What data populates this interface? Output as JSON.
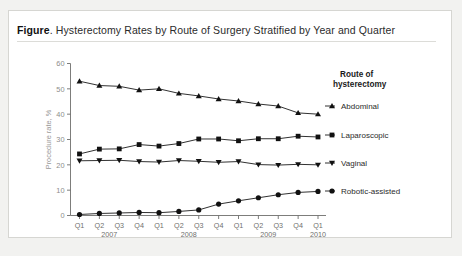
{
  "figure": {
    "label_lead": "Figure",
    "title": ". Hysterectomy Rates by Route of Surgery Stratified by Year and Quarter"
  },
  "chart_data": {
    "type": "line",
    "title": "Hysterectomy Rates by Route of Surgery Stratified by Year and Quarter",
    "xlabel": "",
    "ylabel": "Procedure rate, %",
    "ylim": [
      0,
      60
    ],
    "yticks": [
      0,
      10,
      20,
      30,
      40,
      50,
      60
    ],
    "grid": false,
    "legend_position": "right",
    "legend_title": "Route of hysterectomy",
    "categories": [
      "Q1",
      "Q2",
      "Q3",
      "Q4",
      "Q1",
      "Q2",
      "Q3",
      "Q4",
      "Q1",
      "Q2",
      "Q3",
      "Q4",
      "Q1"
    ],
    "year_groups": [
      {
        "year": "2007",
        "start_index": 0,
        "end_index": 3
      },
      {
        "year": "2008",
        "start_index": 4,
        "end_index": 7
      },
      {
        "year": "2009",
        "start_index": 8,
        "end_index": 11
      },
      {
        "year": "2010",
        "start_index": 12,
        "end_index": 12
      }
    ],
    "series": [
      {
        "name": "Abdominal",
        "marker": "triangle-up",
        "values": [
          53.0,
          51.3,
          51.0,
          49.5,
          50.0,
          48.2,
          47.2,
          46.0,
          45.2,
          44.0,
          43.2,
          40.5,
          40.0
        ]
      },
      {
        "name": "Laparoscopic",
        "marker": "square",
        "values": [
          24.3,
          26.2,
          26.3,
          28.0,
          27.4,
          28.4,
          30.2,
          30.2,
          29.5,
          30.3,
          30.3,
          31.3,
          31.0
        ]
      },
      {
        "name": "Vaginal",
        "marker": "triangle-down",
        "values": [
          21.6,
          21.7,
          21.8,
          21.3,
          21.1,
          21.7,
          21.4,
          21.0,
          21.3,
          20.1,
          19.9,
          20.2,
          20.0
        ]
      },
      {
        "name": "Robotic-assisted",
        "marker": "circle",
        "values": [
          0.4,
          0.8,
          1.0,
          1.2,
          1.1,
          1.6,
          2.2,
          4.5,
          5.8,
          7.0,
          8.2,
          9.1,
          9.5
        ]
      }
    ]
  }
}
